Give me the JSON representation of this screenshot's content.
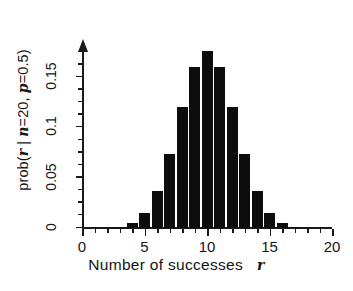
{
  "chart_data": {
    "type": "bar",
    "title": "",
    "subtitle": "",
    "xlabel": "Number of successes",
    "xlabel_variable": "r",
    "ylabel": "prob(",
    "ylabel_var_r": "r",
    "ylabel_mid": " | ",
    "ylabel_var_n": "n",
    "ylabel_n_val": "=20, ",
    "ylabel_var_p": "p",
    "ylabel_p_val": "=0.5)",
    "ylabel_full": "prob(r | n=20, p=0.5)",
    "distribution": "binomial",
    "parameters": {
      "n": 20,
      "p": 0.5
    },
    "grid": false,
    "legend": null,
    "xlim": [
      0,
      20
    ],
    "ylim": [
      0,
      0.19
    ],
    "xticks": [
      0,
      5,
      10,
      15,
      20
    ],
    "xtick_labels": [
      "0",
      "5",
      "10",
      "15",
      "20"
    ],
    "xticks_minor": [
      1,
      2,
      3,
      4,
      6,
      7,
      8,
      9,
      11,
      12,
      13,
      14,
      16,
      17,
      18,
      19
    ],
    "yticks": [
      0,
      0.05,
      0.1,
      0.15
    ],
    "ytick_labels": [
      "0",
      "0.05",
      "0.1",
      "0.15"
    ],
    "yticks_minor": [
      0.0125,
      0.025,
      0.0375,
      0.0625,
      0.075,
      0.0875,
      0.1125,
      0.125,
      0.1375,
      0.1625,
      0.175
    ],
    "bar_color": "#0d0d0d",
    "categories": [
      0,
      1,
      2,
      3,
      4,
      5,
      6,
      7,
      8,
      9,
      10,
      11,
      12,
      13,
      14,
      15,
      16,
      17,
      18,
      19,
      20
    ],
    "values": [
      1e-06,
      1.9e-05,
      0.000181,
      0.001087,
      0.004621,
      0.014786,
      0.036964,
      0.073929,
      0.120134,
      0.160179,
      0.176197,
      0.160179,
      0.120134,
      0.073929,
      0.036964,
      0.014786,
      0.004621,
      0.001087,
      0.000181,
      1.9e-05,
      1e-06
    ]
  }
}
